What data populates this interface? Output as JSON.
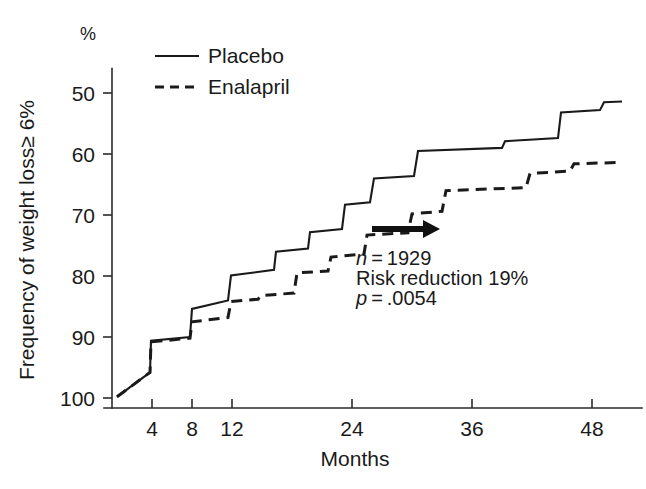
{
  "chart_data": {
    "type": "line",
    "subtype": "kaplan-meier-step",
    "title": "",
    "xlabel": "Months",
    "ylabel": "Frequency of weight loss≥ 6%",
    "yunit": "%",
    "xlim": [
      0,
      51
    ],
    "ylim": [
      100,
      46
    ],
    "y_inverted": true,
    "grid": false,
    "xticks": [
      4,
      8,
      12,
      24,
      36,
      48
    ],
    "xtick_labels": [
      "4",
      "8",
      "12",
      "24",
      "36",
      "48"
    ],
    "yticks": [
      50,
      60,
      70,
      80,
      90,
      100
    ],
    "ytick_labels": [
      "50",
      "60",
      "70",
      "80",
      "90",
      "100"
    ],
    "legend_position": "top-left-inside",
    "series": [
      {
        "name": "Placebo",
        "style": "solid",
        "points": [
          [
            0.5,
            99.8
          ],
          [
            3.8,
            95.8
          ],
          [
            3.9,
            90.6
          ],
          [
            7.8,
            90.0
          ],
          [
            8.0,
            85.4
          ],
          [
            11.6,
            84.0
          ],
          [
            11.9,
            79.9
          ],
          [
            16.2,
            79.0
          ],
          [
            16.4,
            76.0
          ],
          [
            19.6,
            75.5
          ],
          [
            19.8,
            72.8
          ],
          [
            23.0,
            72.3
          ],
          [
            23.3,
            68.3
          ],
          [
            25.8,
            67.9
          ],
          [
            26.2,
            64.0
          ],
          [
            30.2,
            63.6
          ],
          [
            30.6,
            59.5
          ],
          [
            39.0,
            59.0
          ],
          [
            39.3,
            57.9
          ],
          [
            44.6,
            57.4
          ],
          [
            44.9,
            53.2
          ],
          [
            48.8,
            52.8
          ],
          [
            49.2,
            51.5
          ],
          [
            51.0,
            51.4
          ]
        ]
      },
      {
        "name": "Enalapril",
        "style": "dashed",
        "points": [
          [
            0.5,
            99.8
          ],
          [
            3.8,
            95.8
          ],
          [
            3.9,
            90.8
          ],
          [
            7.8,
            90.2
          ],
          [
            8.0,
            87.5
          ],
          [
            11.6,
            86.8
          ],
          [
            11.9,
            84.2
          ],
          [
            14.6,
            83.8
          ],
          [
            14.9,
            83.2
          ],
          [
            18.2,
            82.8
          ],
          [
            18.5,
            79.5
          ],
          [
            21.6,
            79.2
          ],
          [
            21.9,
            76.9
          ],
          [
            25.2,
            76.4
          ],
          [
            25.5,
            73.3
          ],
          [
            29.6,
            72.9
          ],
          [
            30.0,
            69.8
          ],
          [
            33.0,
            69.4
          ],
          [
            33.4,
            66.0
          ],
          [
            41.4,
            65.5
          ],
          [
            41.8,
            63.2
          ],
          [
            45.8,
            62.8
          ],
          [
            46.2,
            61.6
          ],
          [
            50.6,
            61.4
          ]
        ]
      }
    ],
    "annotations": [
      {
        "id": "n",
        "text": "n = 1929",
        "italic_prefix": "n",
        "x": 24.4,
        "y": 78.2
      },
      {
        "id": "risk",
        "text": "Risk reduction 19%",
        "italic_prefix": "",
        "x": 24.4,
        "y": 81.5
      },
      {
        "id": "p",
        "text": "p = .0054",
        "italic_prefix": "p",
        "x": 24.4,
        "y": 84.8
      }
    ],
    "arrow": {
      "name": "separation-arrow",
      "x_start": 26.0,
      "x_end": 32.8,
      "y": 72.3,
      "direction": "right",
      "color": "#111111"
    }
  },
  "axis": {
    "y_unit_label": "%",
    "y_title": "Frequency of weight loss≥ 6%",
    "x_title": "Months"
  },
  "legend": {
    "items": [
      {
        "label": "Placebo",
        "style": "solid"
      },
      {
        "label": "Enalapril",
        "style": "dashed"
      }
    ]
  },
  "annotation_lines": {
    "line1": "n = 1929",
    "line2": "Risk reduction 19%",
    "line3": "p = .0054"
  },
  "colors": {
    "ink": "#1a1a1a",
    "axis": "#2b2b2b",
    "arrow": "#111111",
    "background": "#ffffff"
  }
}
